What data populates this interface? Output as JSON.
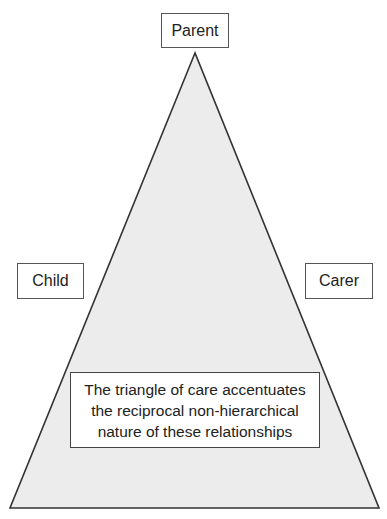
{
  "diagram": {
    "type": "triangle",
    "fill_color": "#ececec",
    "stroke_color": "#333333",
    "apex": [
      195,
      53
    ],
    "base_left": [
      10,
      508
    ],
    "base_right": [
      379,
      508
    ]
  },
  "nodes": {
    "top": {
      "label": "Parent"
    },
    "left": {
      "label": "Child"
    },
    "right": {
      "label": "Carer"
    }
  },
  "caption": {
    "lines": [
      "The triangle of care accentuates",
      "the reciprocal non-hierarchical",
      "nature of these relationships"
    ]
  }
}
